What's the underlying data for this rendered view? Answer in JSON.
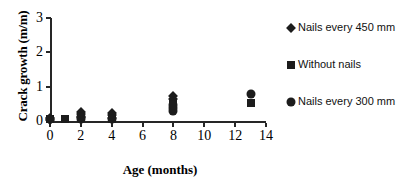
{
  "chart_data": {
    "type": "scatter",
    "title": "",
    "xlabel": "Age (months)",
    "ylabel": "Crack growth (m/m)",
    "xlim": [
      0,
      14
    ],
    "ylim": [
      0,
      3
    ],
    "xticks": [
      0,
      2,
      4,
      6,
      8,
      10,
      12,
      14
    ],
    "yticks": [
      0,
      1,
      2,
      3
    ],
    "xtick_labels": [
      "0",
      "2",
      "4",
      "6",
      "8",
      "10",
      "12",
      "14"
    ],
    "ytick_labels": [
      "0",
      "1",
      "2",
      "3"
    ],
    "grid": false,
    "legend_position": "right",
    "series": [
      {
        "name": "Nails every 450 mm",
        "marker": "diamond",
        "color": "#1c1c1c",
        "points": [
          {
            "x": 0,
            "y": 0.1
          },
          {
            "x": 0,
            "y": 0.04
          },
          {
            "x": 2,
            "y": 0.26
          },
          {
            "x": 2,
            "y": 0.2
          },
          {
            "x": 2,
            "y": 0.13
          },
          {
            "x": 4,
            "y": 0.24
          },
          {
            "x": 4,
            "y": 0.17
          },
          {
            "x": 4,
            "y": 0.1
          },
          {
            "x": 8,
            "y": 0.72
          },
          {
            "x": 8,
            "y": 0.64
          }
        ]
      },
      {
        "name": "Without nails",
        "marker": "square",
        "color": "#1c1c1c",
        "points": [
          {
            "x": 0,
            "y": 0.06
          },
          {
            "x": 1,
            "y": 0.05
          },
          {
            "x": 2,
            "y": 0.08
          },
          {
            "x": 4,
            "y": 0.06
          },
          {
            "x": 8,
            "y": 0.42
          },
          {
            "x": 8,
            "y": 0.5
          },
          {
            "x": 13,
            "y": 0.52
          }
        ]
      },
      {
        "name": "Nails every 300 mm",
        "marker": "circle",
        "color": "#1c1c1c",
        "points": [
          {
            "x": 0,
            "y": 0.05
          },
          {
            "x": 2,
            "y": 0.05
          },
          {
            "x": 2,
            "y": 0.12
          },
          {
            "x": 4,
            "y": 0.05
          },
          {
            "x": 8,
            "y": 0.3
          },
          {
            "x": 8,
            "y": 0.38
          },
          {
            "x": 8,
            "y": 0.46
          },
          {
            "x": 13,
            "y": 0.8
          }
        ]
      }
    ],
    "legend": [
      {
        "label": "Nails every 450 mm",
        "marker": "diamond"
      },
      {
        "label": "Without nails",
        "marker": "square"
      },
      {
        "label": "Nails every 300 mm",
        "marker": "circle"
      }
    ]
  }
}
